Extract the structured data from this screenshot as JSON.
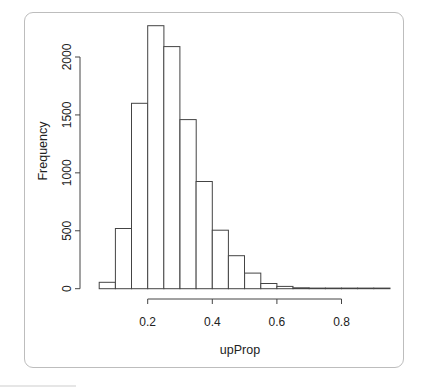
{
  "chart_data": {
    "type": "bar",
    "subtype": "histogram",
    "title": "",
    "xlabel": "upProp",
    "ylabel": "Frequency",
    "bin_width": 0.05,
    "bins": [
      [
        0.05,
        0.1
      ],
      [
        0.1,
        0.15
      ],
      [
        0.15,
        0.2
      ],
      [
        0.2,
        0.25
      ],
      [
        0.25,
        0.3
      ],
      [
        0.3,
        0.35
      ],
      [
        0.35,
        0.4
      ],
      [
        0.4,
        0.45
      ],
      [
        0.45,
        0.5
      ],
      [
        0.5,
        0.55
      ],
      [
        0.55,
        0.6
      ],
      [
        0.6,
        0.65
      ],
      [
        0.65,
        0.7
      ],
      [
        0.7,
        0.75
      ],
      [
        0.75,
        0.8
      ],
      [
        0.8,
        0.85
      ],
      [
        0.85,
        0.9
      ],
      [
        0.9,
        0.95
      ]
    ],
    "values": [
      55,
      520,
      1600,
      2270,
      2090,
      1460,
      925,
      505,
      285,
      135,
      45,
      20,
      8,
      3,
      2,
      1,
      1,
      1
    ],
    "xlim": [
      0.05,
      0.95
    ],
    "ylim": [
      0,
      2270
    ],
    "x_ticks": [
      0.2,
      0.4,
      0.6,
      0.8
    ],
    "x_tick_labels": [
      "0.2",
      "0.4",
      "0.6",
      "0.8"
    ],
    "y_ticks": [
      0,
      500,
      1000,
      1500,
      2000
    ],
    "y_tick_labels": [
      "0",
      "500",
      "1000",
      "1500",
      "2000"
    ],
    "grid": false,
    "legend": null,
    "bar_fill": "#ffffff",
    "bar_stroke": "#444444"
  }
}
